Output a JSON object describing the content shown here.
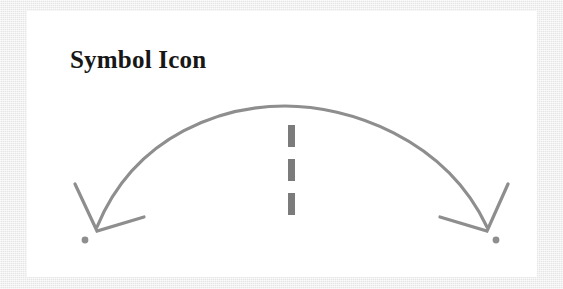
{
  "canvas": {
    "width": 563,
    "height": 289,
    "background_color": "#ebebeb",
    "card_background_color": "#ffffff"
  },
  "card": {
    "title": "Symbol Icon",
    "title_color": "#171717"
  },
  "figure": {
    "name": "double-headed-arc-arrow-with-dashed-divider",
    "stroke_color": "#8e8e8e",
    "dash_color": "#7b7b7b",
    "dot_color": "#8e8e8e",
    "stroke_width": 3.2,
    "arc": {
      "start_x": 70,
      "start_y": 216,
      "peak_x": 258,
      "peak_y": 95,
      "end_x": 460,
      "end_y": 216
    },
    "left_arrowhead": {
      "tip_x": 70,
      "tip_y": 216,
      "label": "arrow-left-down"
    },
    "right_arrowhead": {
      "tip_x": 460,
      "tip_y": 216,
      "label": "arrow-right-down"
    },
    "left_dot": {
      "cx": 58,
      "cy": 229,
      "r": 3.4
    },
    "right_dot": {
      "cx": 469,
      "cy": 229,
      "r": 3.4
    },
    "dashes": [
      {
        "x": 261,
        "y": 114,
        "width": 7,
        "height": 22
      },
      {
        "x": 261,
        "y": 148,
        "width": 7,
        "height": 22
      },
      {
        "x": 261,
        "y": 182,
        "width": 7,
        "height": 22
      }
    ]
  }
}
